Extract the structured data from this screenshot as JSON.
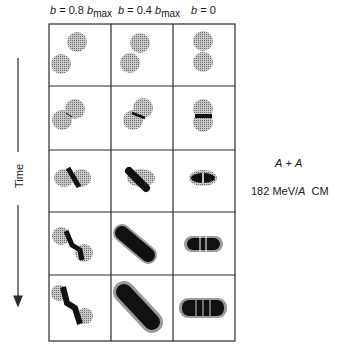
{
  "figure": {
    "columns": [
      {
        "prefix": "b = 0.8 ",
        "var": "b",
        "sub": "max",
        "full": "b = 0.8 b_max"
      },
      {
        "prefix": "b = 0.4 ",
        "var": "b",
        "sub": "max",
        "full": "b = 0.4 b_max"
      },
      {
        "prefix": "b = 0",
        "var": "",
        "sub": "",
        "full": "b = 0"
      }
    ],
    "axis_label": "Time",
    "system_label": "A + A",
    "energy_label": "182 MeV/A  CM",
    "rows": 5,
    "colors": {
      "line": "#2b2b2b",
      "nucleus_fill": "#9a9a9a",
      "compressed_matter": "#111111",
      "background": "#ffffff"
    }
  }
}
